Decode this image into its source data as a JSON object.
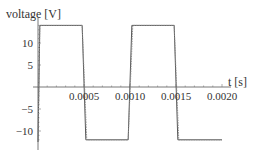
{
  "chart_data": {
    "type": "line",
    "title": "",
    "xlabel": "t [s]",
    "ylabel": "voltage [V]",
    "xlim": [
      -5e-05,
      0.0021
    ],
    "ylim": [
      -13,
      14.5
    ],
    "x_ticks": [
      "0.0005",
      "0.0010",
      "0.0015",
      "0.0020"
    ],
    "x_tick_values": [
      0.0005,
      0.001,
      0.0015,
      0.002
    ],
    "y_ticks": [
      "-10",
      "-5",
      "5",
      "10"
    ],
    "y_tick_values": [
      -10,
      -5,
      5,
      10
    ],
    "grid": false,
    "legend": null,
    "series": [
      {
        "name": "square wave (solid)",
        "style": "solid",
        "x": [
          0.0,
          2e-05,
          0.00048,
          0.00052,
          0.00098,
          0.00102,
          0.00148,
          0.00152,
          0.002
        ],
        "y": [
          -12.5,
          14,
          14,
          -12,
          -12,
          14,
          14,
          -12,
          -12
        ]
      },
      {
        "name": "square wave (dashed)",
        "style": "dashed",
        "x": [
          0.0,
          2e-05,
          0.00048,
          0.00053,
          0.00098,
          0.00103,
          0.00148,
          0.00153,
          0.002
        ],
        "y": [
          -12.5,
          14,
          14,
          -12,
          -12,
          14,
          14,
          -12,
          -12
        ]
      }
    ]
  }
}
